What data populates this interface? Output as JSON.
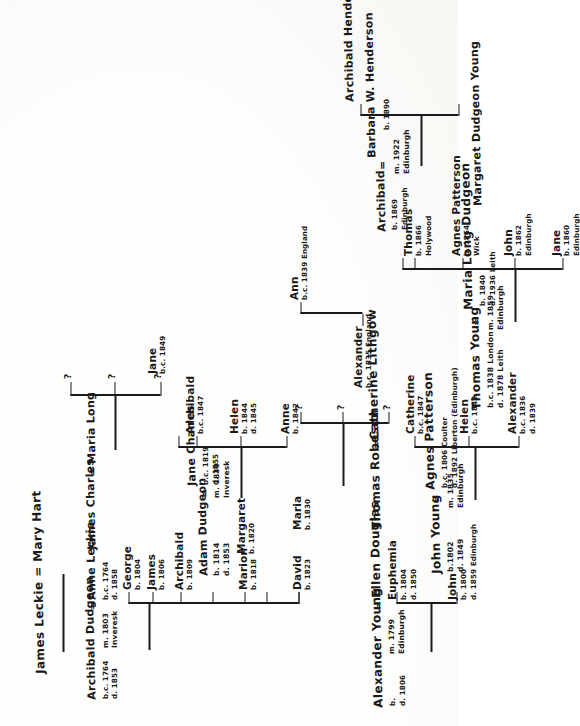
{
  "document": {
    "kind": "handwritten-genealogy-chart",
    "orientation": "landscape chart photographed in portrait (rotated 90° counter-clockwise)",
    "ink_color": "#1a1a1a",
    "paper_color": "#fefefe"
  },
  "generation1": {
    "leckie": {
      "union": "James Leckie  =  Mary Hart"
    }
  },
  "generation2": {
    "dudgeon_leckie": {
      "husband": "Archibald Dudgeon",
      "husband_dates": [
        "b.c. 1764",
        "d. 1853"
      ],
      "equals": "=",
      "wife": "Anne Leckie",
      "wife_dates": [
        "b.c. 1764",
        "d. 1858"
      ],
      "marriage": [
        "m. 1803",
        "Inveresk"
      ]
    },
    "charles_long": {
      "husband": "James Charles",
      "equals": "=",
      "wife": "Maria Long",
      "children_unknown": [
        "?",
        "?",
        "?"
      ]
    },
    "young_douglas": {
      "husband": "Alexander Young",
      "husband_dates": [
        "b.",
        "d. 1806"
      ],
      "equals": "=",
      "wife": "Ellen Douglas",
      "marriage": [
        "m. 1799",
        "Edinburgh"
      ]
    },
    "robeson_lithgow": {
      "husband": "Thomas Robeson",
      "equals": "=",
      "wife": "Catherine Lithgow",
      "children_unknown": [
        "?",
        "?",
        "?"
      ]
    }
  },
  "generation3": {
    "dudgeon_children": [
      {
        "name": "George",
        "dates": [
          "b. 1804"
        ]
      },
      {
        "name": "James",
        "dates": [
          "b. 1806"
        ]
      },
      {
        "name": "Archibald",
        "dates": [
          "b. 1809"
        ]
      },
      {
        "name": "Adam",
        "dates": [
          "b. 1814",
          "d. 1853"
        ]
      },
      {
        "name": "Marion",
        "dates": [
          "b. 1818"
        ]
      },
      {
        "name": "Margaret",
        "dates": [
          "b. 1820"
        ]
      },
      {
        "name": "David",
        "dates": [
          "b. 1823"
        ]
      },
      {
        "name": "Maria",
        "dates": [
          "b. 1830"
        ]
      }
    ],
    "adam_union": {
      "husband": "Adam  Dudgeon",
      "equals": "=",
      "wife": "Jane  Charles",
      "wife_dates": [
        "b.c. 1819",
        "d.  1855"
      ],
      "marriage": [
        "m. 1839",
        "Inveresk"
      ]
    },
    "young_children": [
      {
        "name": "John",
        "dates": [
          "b. 1800",
          "d. 1859 Edinburgh"
        ]
      },
      {
        "name": "Euphemia",
        "dates": [
          "b. 1804",
          "d. 1850"
        ]
      },
      {
        "name": "Alexander",
        "dates": [
          "b.c. 1834",
          "d. 1839"
        ]
      }
    ],
    "john_union": {
      "husband": "John  Young",
      "husband_dates": [
        "b.1802",
        "d. 1849"
      ],
      "equals": "=",
      "wife": "Agnes  Patterson",
      "wife_dates": [
        "b.c. 1806 Coulter",
        "d. 1892 Liberton (Edinburgh)"
      ],
      "marriage": [
        "m. 1835",
        "Edinburgh"
      ]
    }
  },
  "generation4": {
    "adam_children": [
      {
        "name": "Anne",
        "dates": [
          "b. 1842"
        ]
      },
      {
        "name": "Helen",
        "dates": [
          "b. 1844",
          "d. 1845"
        ]
      },
      {
        "name": "Archibald",
        "dates": [
          "b.c. 1847"
        ]
      },
      {
        "name": "Jane",
        "dates": [
          "b.c. 1849"
        ]
      }
    ],
    "john_children": [
      {
        "name": "Alexander",
        "dates": [
          "b.c. 1836",
          "d. 1839"
        ]
      },
      {
        "name": "Helen",
        "dates": [
          "b.c. 1842"
        ]
      },
      {
        "name": "Catherine",
        "dates": [
          "b.c. 1847"
        ]
      }
    ],
    "thomas_union": {
      "husband": "Thomas  Young",
      "husband_dates": [
        "b.c. 1838 London",
        "d. 1878 Leith"
      ],
      "equals": "=",
      "wife": "Maria  Long  Dudgeon",
      "wife_dates": [
        "b. 1840",
        "d. 1936 Leith"
      ],
      "marriage": [
        "m. 1859",
        "Edinburgh"
      ]
    }
  },
  "generation5": {
    "thomas_children": [
      {
        "name": "Jane",
        "dates": [
          "b. 1860",
          "Edinburgh"
        ]
      },
      {
        "name": "John",
        "dates": [
          "b. 1862",
          "Edinburgh"
        ]
      },
      {
        "name": "Agnes Patterson",
        "dates": [
          "b. 1864",
          "Wick"
        ]
      },
      {
        "name": "Thomas",
        "dates": [
          "b. 1866",
          "Holywood"
        ]
      },
      {
        "name": "Alexander",
        "dates": [
          "b.c. 1835 England"
        ]
      },
      {
        "name": "Ann",
        "dates": [
          "b.c. 1839 England"
        ]
      },
      {
        "name": "Archibald",
        "dates": [
          "b. 1869",
          "Edinburgh"
        ]
      }
    ],
    "archibald_union": {
      "husband": "Archibald",
      "husband_dates": [
        "b. 1869",
        "Edinburgh"
      ],
      "equals": "=",
      "wife": "Barbara  W.  Henderson",
      "wife_dates": [
        "b. 1890"
      ],
      "marriage": [
        "m. 1922",
        "Edinburgh"
      ]
    }
  },
  "generation6": {
    "children": [
      {
        "name": "Margaret  Dudgeon  Young"
      },
      {
        "name": "Archibald  Henderson  Young"
      }
    ]
  }
}
